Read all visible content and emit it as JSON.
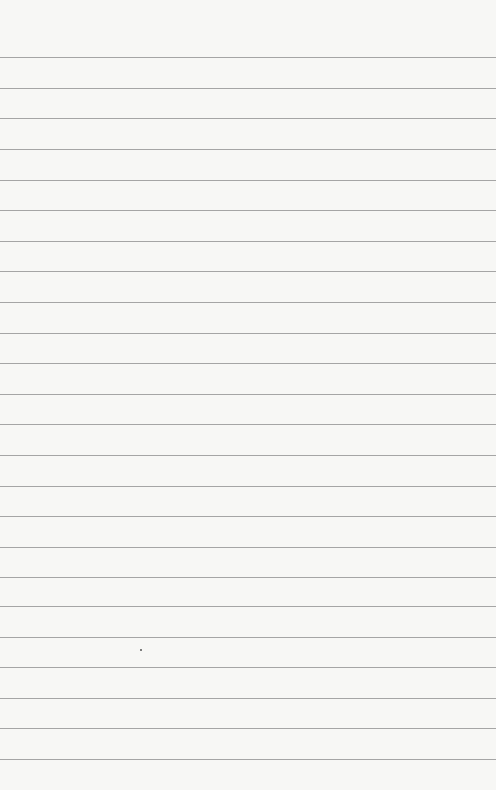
{
  "image": {
    "type": "lined-paper",
    "description": "Blank sheet of ruled notebook paper with faint bleed-through",
    "background_color": "#f7f7f5",
    "rule_color": "#8a8a8a",
    "rule_positions_y": [
      57,
      88,
      118,
      149,
      180,
      210,
      241,
      271,
      302,
      333,
      363,
      394,
      424,
      455,
      486,
      516,
      547,
      577,
      606,
      637,
      667,
      698,
      728,
      759
    ],
    "speck": {
      "x": 140,
      "y": 649
    }
  }
}
